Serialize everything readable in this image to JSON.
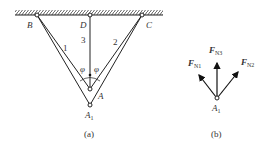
{
  "figure_a": {
    "caption": "(a)",
    "points": {
      "B": "B",
      "D": "D",
      "C": "C",
      "A": "A",
      "A1_main": "A",
      "A1_sub": "1"
    },
    "bars": {
      "bar1": "1",
      "bar2": "2",
      "bar3": "3"
    },
    "angle_left": "φ",
    "angle_right": "φ"
  },
  "figure_b": {
    "caption": "(b)",
    "node_main": "A",
    "node_sub": "1",
    "forces": {
      "fn1_main": "F",
      "fn1_sub": "N1",
      "fn2_main": "F",
      "fn2_sub": "N2",
      "fn3_main": "F",
      "fn3_sub": "N3"
    }
  },
  "colors": {
    "line": "#222222",
    "text": "#333333"
  }
}
